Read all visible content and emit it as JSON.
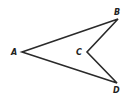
{
  "figure": {
    "type": "concave quadrilateral (arrowhead)",
    "stroke_color": "#2a2a2a",
    "background": "#ffffff",
    "vertices": [
      {
        "label": "A",
        "x": 22,
        "y": 52
      },
      {
        "label": "B",
        "x": 118,
        "y": 19
      },
      {
        "label": "C",
        "x": 87,
        "y": 52
      },
      {
        "label": "D",
        "x": 117,
        "y": 83
      }
    ],
    "labels": {
      "A": "A",
      "B": "B",
      "C": "C",
      "D": "D"
    }
  }
}
